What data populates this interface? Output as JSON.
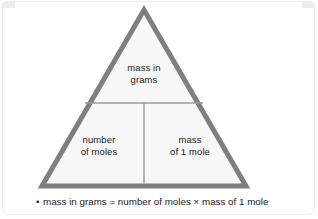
{
  "diagram": {
    "type": "mole-relationship-triangle",
    "colors": {
      "border": "#7f7f7f",
      "fill": "#f7f7f7",
      "divider": "#9a9a9a",
      "text": "#1c1c1c",
      "background": "#ffffff"
    },
    "cells": {
      "top": "mass in\ngrams",
      "bottom_left": "number\nof moles",
      "bottom_right": "mass\nof 1 mole"
    }
  },
  "notes": {
    "bullet": "•",
    "lines": [
      "mass in grams = number of moles × mass of 1 mole"
    ]
  }
}
